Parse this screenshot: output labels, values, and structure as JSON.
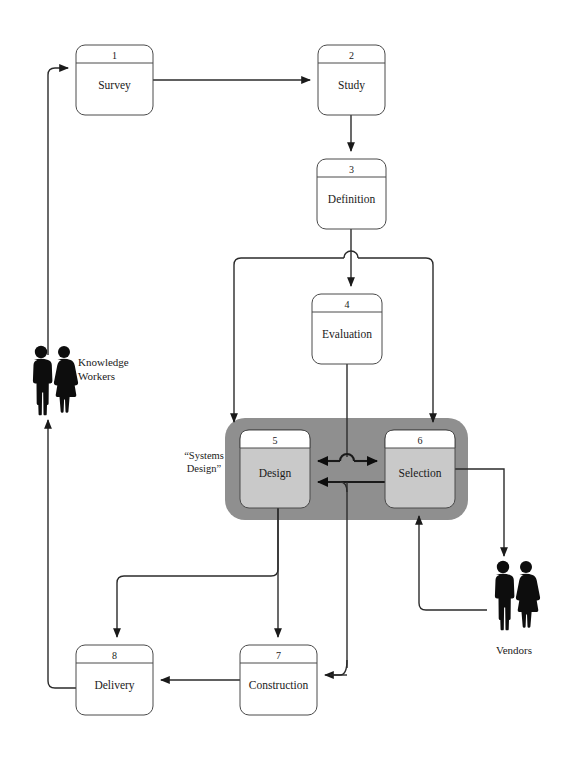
{
  "diagram": {
    "colors": {
      "group_fill": "#8f8f8f",
      "box_fill": "#ffffff",
      "box_fill_highlight": "#c9c9c9",
      "stroke": "#2b2b2b",
      "silhouette": "#0d0d0d",
      "background": "#ffffff"
    },
    "group": {
      "label": "“Systems Design”",
      "name": "systems-design-group"
    },
    "nodes": [
      {
        "id": "n1",
        "number": "1",
        "label": "Survey",
        "x": 76,
        "y": 45,
        "w": 77,
        "h": 70,
        "highlight": false
      },
      {
        "id": "n2",
        "number": "2",
        "label": "Study",
        "x": 318,
        "y": 45,
        "w": 67,
        "h": 70,
        "highlight": false
      },
      {
        "id": "n3",
        "number": "3",
        "label": "Definition",
        "x": 317,
        "y": 159,
        "w": 69,
        "h": 70,
        "highlight": false
      },
      {
        "id": "n4",
        "number": "4",
        "label": "Evaluation",
        "x": 312,
        "y": 294,
        "w": 70,
        "h": 70,
        "highlight": false
      },
      {
        "id": "n5",
        "number": "5",
        "label": "Design",
        "x": 240,
        "y": 430,
        "w": 70,
        "h": 78,
        "highlight": true
      },
      {
        "id": "n6",
        "number": "6",
        "label": "Selection",
        "x": 385,
        "y": 430,
        "w": 70,
        "h": 78,
        "highlight": true
      },
      {
        "id": "n7",
        "number": "7",
        "label": "Construction",
        "x": 240,
        "y": 645,
        "w": 77,
        "h": 70,
        "highlight": false
      },
      {
        "id": "n8",
        "number": "8",
        "label": "Delivery",
        "x": 76,
        "y": 645,
        "w": 77,
        "h": 70,
        "highlight": false
      }
    ],
    "actors": [
      {
        "id": "a1",
        "label": "Knowledge\nWorkers",
        "line1": "Knowledge",
        "line2": "Workers",
        "x": 30,
        "y": 345
      },
      {
        "id": "a2",
        "label": "Vendors",
        "line1": "Vendors",
        "line2": "",
        "x": 488,
        "y": 560
      }
    ],
    "edges": [
      {
        "from": "knowledge-workers",
        "to": "survey",
        "name": "edge-workers-to-survey"
      },
      {
        "from": "survey",
        "to": "study",
        "name": "edge-survey-to-study"
      },
      {
        "from": "study",
        "to": "definition",
        "name": "edge-study-to-definition"
      },
      {
        "from": "definition",
        "to": "evaluation",
        "name": "edge-definition-to-evaluation"
      },
      {
        "from": "definition",
        "to": "design",
        "name": "edge-definition-to-design"
      },
      {
        "from": "definition",
        "to": "selection",
        "name": "edge-definition-to-selection"
      },
      {
        "from": "evaluation",
        "to": "design-selection-bus",
        "name": "edge-evaluation-to-bus"
      },
      {
        "from": "design",
        "to": "selection",
        "name": "edge-design-to-selection"
      },
      {
        "from": "selection",
        "to": "design",
        "name": "edge-selection-to-design"
      },
      {
        "from": "design",
        "to": "delivery",
        "name": "edge-design-to-delivery"
      },
      {
        "from": "design",
        "to": "construction",
        "name": "edge-design-to-construction"
      },
      {
        "from": "selection",
        "to": "vendors",
        "name": "edge-selection-to-vendors"
      },
      {
        "from": "vendors",
        "to": "selection",
        "name": "edge-vendors-to-selection"
      },
      {
        "from": "selection",
        "to": "construction",
        "name": "edge-selection-to-construction"
      },
      {
        "from": "construction",
        "to": "delivery",
        "name": "edge-construction-to-delivery"
      },
      {
        "from": "delivery",
        "to": "knowledge-workers",
        "name": "edge-delivery-to-workers"
      }
    ]
  }
}
